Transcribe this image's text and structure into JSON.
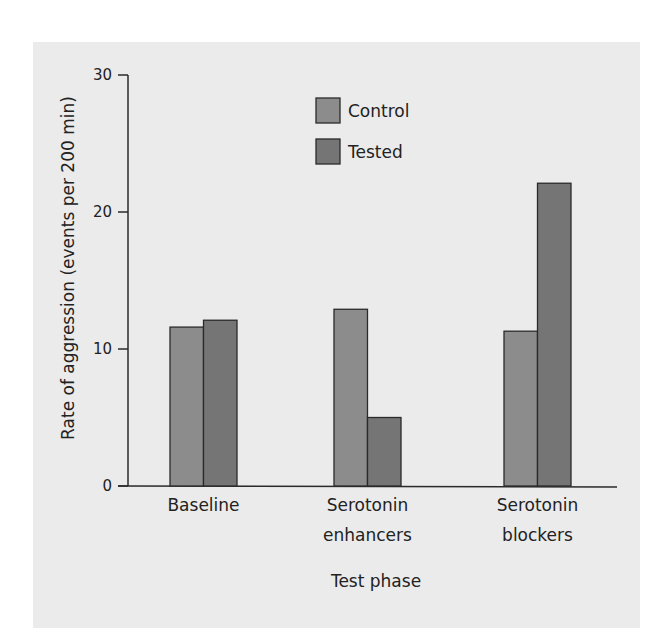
{
  "chart_data": {
    "type": "bar",
    "title": "",
    "xlabel": "Test phase",
    "ylabel": "Rate of aggression (events per 200 min)",
    "categories": [
      "Baseline",
      "Serotonin enhancers",
      "Serotonin blockers"
    ],
    "category_lines": [
      [
        "Baseline"
      ],
      [
        "Serotonin",
        "enhancers"
      ],
      [
        "Serotonin",
        "blockers"
      ]
    ],
    "series": [
      {
        "name": "Control",
        "values": [
          11.6,
          12.9,
          11.3
        ],
        "color": "#8c8c8c"
      },
      {
        "name": "Tested",
        "values": [
          12.1,
          5.0,
          22.1
        ],
        "color": "#757575"
      }
    ],
    "ylim": [
      0,
      30
    ],
    "yticks": [
      0,
      10,
      20,
      30
    ],
    "grid": false,
    "legend_position": "top-center"
  },
  "legend": {
    "items": [
      {
        "label": "Control"
      },
      {
        "label": "Tested"
      }
    ]
  }
}
